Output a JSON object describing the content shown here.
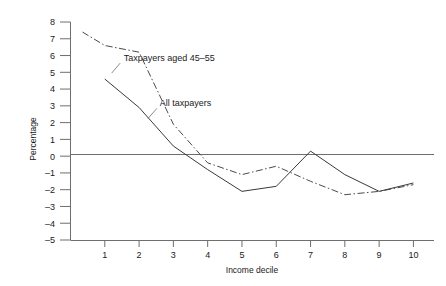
{
  "chart_data": {
    "type": "line",
    "title": "",
    "xlabel": "Income decile",
    "ylabel": "Percentage",
    "xlim": [
      0,
      10.6
    ],
    "ylim": [
      -5,
      8
    ],
    "grid": false,
    "legend_position": "inline-annotations",
    "x_ticks": [
      "1",
      "2",
      "3",
      "4",
      "5",
      "6",
      "7",
      "8",
      "9",
      "10"
    ],
    "y_ticks": [
      "8",
      "7",
      "6",
      "5",
      "4",
      "3",
      "2",
      "1",
      "0",
      "-1",
      "-2",
      "-3",
      "-4",
      "-5"
    ],
    "zero_reference_line": 0,
    "categories": [
      1,
      2,
      3,
      4,
      5,
      6,
      7,
      8,
      9,
      10
    ],
    "series": [
      {
        "name": "Taxpayers aged 45-55",
        "style": "dash-dot",
        "label": "Taxpayers aged 45–55",
        "x": [
          0.35,
          1,
          2,
          3,
          4,
          5,
          6,
          7,
          8,
          9,
          10
        ],
        "values": [
          7.4,
          6.6,
          6.2,
          1.9,
          -0.4,
          -1.1,
          -0.6,
          -1.5,
          -2.3,
          -2.1,
          -1.7
        ]
      },
      {
        "name": "All taxpayers",
        "style": "solid",
        "label": "All taxpayers",
        "x": [
          1,
          2,
          3,
          4,
          5,
          6,
          7,
          8,
          9,
          10
        ],
        "values": [
          4.6,
          2.9,
          0.6,
          -0.8,
          -2.1,
          -1.8,
          0.3,
          -1.1,
          -2.1,
          -1.6
        ]
      }
    ],
    "annotations": [
      {
        "text": "Taxpayers aged 45–55",
        "x": 1.55,
        "y": 5.9
      },
      {
        "text": "All taxpayers",
        "x": 2.6,
        "y": 3.2
      }
    ],
    "colors": {
      "axis": "#6e6e6e",
      "series_solid": "#3a3a3a",
      "series_dashdot": "#4a4a4a",
      "text": "#1a1a1a",
      "background": "#ffffff"
    }
  }
}
